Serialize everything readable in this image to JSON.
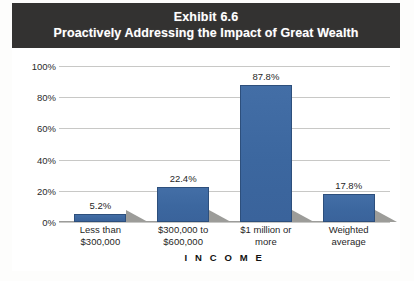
{
  "exhibit": {
    "title_line1": "Exhibit 6.6",
    "title_line2": "Proactively Addressing the Impact of Great Wealth"
  },
  "colors": {
    "bar_fill": "#3f6ba4",
    "bar_border": "#2d4f7c",
    "header_background": "#333231",
    "header_text": "#ffffff",
    "gridline": "#c8c8c6",
    "shadow": "#9c9c99"
  },
  "chart_data": {
    "type": "bar",
    "title": "Proactively Addressing the Impact of Great Wealth",
    "categories": [
      "Less than $300,000",
      "$300,000 to $600,000",
      "$1 million or more",
      "Weighted average"
    ],
    "category_lines": [
      [
        "Less than",
        "$300,000"
      ],
      [
        "$300,000 to",
        "$600,000"
      ],
      [
        "$1 million or",
        "more"
      ],
      [
        "Weighted",
        "average"
      ]
    ],
    "values": [
      5.2,
      22.4,
      87.8,
      17.8
    ],
    "value_labels": [
      "5.2%",
      "22.4%",
      "87.8%",
      "17.8%"
    ],
    "xlabel": "INCOME",
    "xlabel_display": "I N C O M E",
    "ylabel": "",
    "ylim": [
      0,
      100
    ],
    "ytick_values": [
      0,
      20,
      40,
      60,
      80,
      100
    ],
    "ytick_labels": [
      "0%",
      "20%",
      "40%",
      "60%",
      "80%",
      "100%"
    ],
    "grid": true,
    "legend": false
  }
}
